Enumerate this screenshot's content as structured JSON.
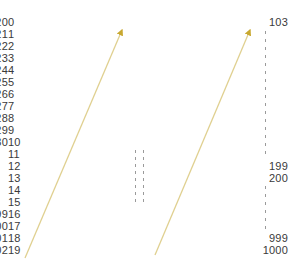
{
  "diagram": {
    "background_color": "#ffffff",
    "text_color": "#3a3a3a",
    "line_color": "#e0d090",
    "arrow_color": "#c8a830",
    "dash_color": "#9a9a9a"
  },
  "columns": {
    "left": {
      "name": "first-column",
      "align": "left",
      "values": [
        "0",
        "1",
        "2",
        "3",
        "4",
        "5",
        "6",
        "7",
        "8",
        "9",
        "10",
        "11",
        "12",
        "13",
        "14",
        "15",
        "16",
        "17",
        "18",
        "19"
      ]
    },
    "middle": {
      "name": "second-column",
      "align": "right",
      "top_values": [
        "20",
        "21",
        "22",
        "23",
        "24",
        "25",
        "26",
        "27",
        "28",
        "29",
        "30"
      ],
      "bottom_values": [
        "99",
        "100",
        "101",
        "102"
      ],
      "ellipsis": "vertical-dashed-pair"
    },
    "right": {
      "name": "third-column",
      "align": "right",
      "group_one": [
        "103"
      ],
      "group_two": [
        "199",
        "200"
      ],
      "group_three": [
        "999",
        "1000"
      ],
      "ellipsis": "vertical-dashed-single"
    }
  },
  "arrows": [
    {
      "name": "arrow-first-to-second",
      "from_label": "19",
      "to_label": "21",
      "x1": 25,
      "y1": 258,
      "x2": 122,
      "y2": 30
    },
    {
      "name": "arrow-second-to-third",
      "from_label": "102",
      "to_label": "103",
      "x1": 155,
      "y1": 255,
      "x2": 250,
      "y2": 30
    }
  ]
}
